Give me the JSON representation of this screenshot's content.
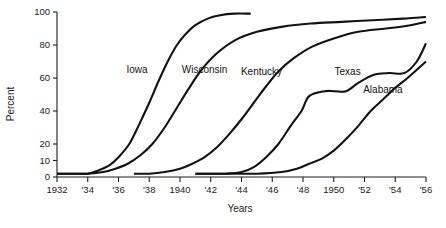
{
  "chart_data": {
    "type": "line",
    "title": "",
    "xlabel": "Years",
    "ylabel": "Percent",
    "xlim": [
      1932,
      1956
    ],
    "ylim": [
      0,
      100
    ],
    "grid": false,
    "legend_position": "inline-labels",
    "x_tick_labels": [
      "1932",
      "'34",
      "'36",
      "'38",
      "1940",
      "'42",
      "'44",
      "'46",
      "'48",
      "1950",
      "'52",
      "'54",
      "'56"
    ],
    "x_tick_values": [
      1932,
      1934,
      1936,
      1938,
      1940,
      1942,
      1944,
      1946,
      1948,
      1950,
      1952,
      1954,
      1956
    ],
    "y_tick_labels": [
      "0",
      "10",
      "20",
      "40",
      "60",
      "80",
      "100"
    ],
    "y_tick_values": [
      0,
      10,
      20,
      40,
      60,
      80,
      100
    ],
    "series": [
      {
        "name": "Iowa",
        "label_x": 1937.2,
        "label_y": 63,
        "x": [
          1932,
          1933,
          1934,
          1934.7,
          1935.4,
          1936,
          1936.7,
          1937.3,
          1938,
          1938.6,
          1939.2,
          1939.8,
          1940.4,
          1941,
          1941.8,
          1942.6,
          1943.5,
          1944.6
        ],
        "y": [
          2,
          2,
          2,
          4,
          7,
          12,
          20,
          31,
          45,
          58,
          70,
          80,
          87,
          92,
          96,
          98,
          99,
          99
        ]
      },
      {
        "name": "Wisconsin",
        "label_x": 1941.6,
        "label_y": 63,
        "x": [
          1932,
          1933,
          1934,
          1935,
          1935.8,
          1936.6,
          1937.4,
          1938.2,
          1939,
          1939.8,
          1940.6,
          1941.4,
          1942.4,
          1943.6,
          1945,
          1946.6,
          1948.5,
          1950.5,
          1952.5,
          1954.5,
          1956
        ],
        "y": [
          2,
          2,
          2,
          3,
          5,
          8,
          13,
          20,
          30,
          42,
          54,
          65,
          75,
          83,
          88,
          91,
          93,
          94,
          95,
          96,
          97
        ]
      },
      {
        "name": "Kentucky",
        "label_x": 1945.3,
        "label_y": 62,
        "x": [
          1937,
          1938,
          1939,
          1940,
          1940.8,
          1941.6,
          1942.4,
          1943.2,
          1944,
          1944.8,
          1945.6,
          1946.4,
          1947.4,
          1948.6,
          1950,
          1951.6,
          1953.4,
          1955,
          1956
        ],
        "y": [
          2,
          2,
          3,
          5,
          8,
          12,
          18,
          26,
          35,
          45,
          55,
          64,
          72,
          79,
          84,
          88,
          90,
          92,
          94
        ]
      },
      {
        "name": "Texas",
        "label_x": 1950.9,
        "label_y": 62,
        "x": [
          1941,
          1942,
          1943,
          1944,
          1944.8,
          1945.6,
          1946.4,
          1947.2,
          1947.9,
          1948.4,
          1949.4,
          1950.1,
          1950.8,
          1951.6,
          1952.6,
          1953.6,
          1954.6,
          1955.4,
          1956
        ],
        "y": [
          2,
          2,
          2,
          3,
          6,
          12,
          20,
          31,
          40,
          49,
          52,
          52,
          52,
          57,
          62,
          63,
          63,
          70,
          81
        ]
      },
      {
        "name": "Alabama",
        "label_x": 1953.2,
        "label_y": 51,
        "x": [
          1941,
          1943,
          1945,
          1946.6,
          1947.6,
          1948.4,
          1949.2,
          1950,
          1950.8,
          1951.6,
          1952.4,
          1953.2,
          1954,
          1954.8,
          1955.4,
          1956
        ],
        "y": [
          2,
          2,
          2,
          3,
          5,
          8,
          11,
          16,
          23,
          31,
          40,
          47,
          54,
          60,
          65,
          70
        ]
      }
    ]
  }
}
